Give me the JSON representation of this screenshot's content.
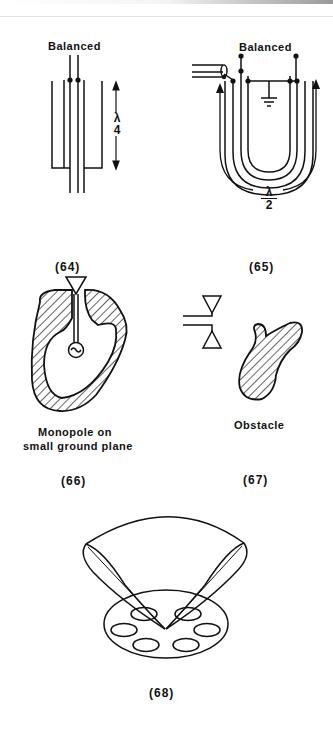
{
  "figures": [
    {
      "id": "64",
      "caption": "(64)",
      "top_label": "Balanced",
      "length_label": "λ/4",
      "length_numerator": "λ",
      "length_denominator": "4",
      "description": "Quarter-wave balun: balanced twin line inside coaxial sleeve"
    },
    {
      "id": "65",
      "caption": "(65)",
      "top_label": "Balanced",
      "length_label": "λ/2",
      "length_numerator": "λ",
      "length_denominator": "2",
      "description": "Half-wave U-loop balun with coax feed and ground symbol"
    },
    {
      "id": "66",
      "caption": "(66)",
      "label_line1": "Monopole on",
      "label_line2": "small ground plane",
      "description": "Monopole with source on hatched small ground plane"
    },
    {
      "id": "67",
      "caption": "(67)",
      "label": "Obstacle",
      "description": "Dipole antenna near hatched obstacle"
    },
    {
      "id": "68",
      "caption": "(68)",
      "description": "Two beam lobes above disc with five elliptical apertures"
    }
  ],
  "colors": {
    "ink": "#111111",
    "background": "#ffffff"
  }
}
